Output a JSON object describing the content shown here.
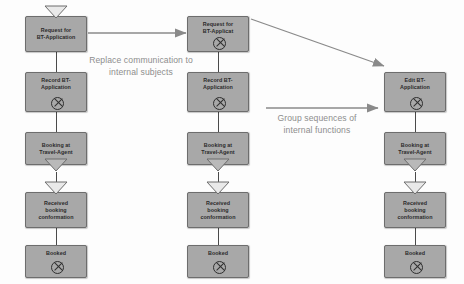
{
  "diagram": {
    "node_fill": "#a8a8a8",
    "node_border": "#6d6d6d",
    "annotation_color": "#8d8d8d",
    "arrow_color": "#8a8a8a",
    "columns": [
      {
        "id": "left",
        "nodes": [
          {
            "id": "l1",
            "label": "Request for\nBT-Application",
            "marker": "receive-triangle-top",
            "end": false
          },
          {
            "id": "l2",
            "label": "Record BT-\nApplication",
            "marker": "none",
            "end": true
          },
          {
            "id": "l3",
            "label": "Booking at\nTravel-Agent",
            "marker": "send-triangle-bottom",
            "end": false
          },
          {
            "id": "l4",
            "label": "Received\nbooking\nconformation",
            "marker": "receive-triangle-top",
            "end": false
          },
          {
            "id": "l5",
            "label": "Booked",
            "marker": "none",
            "end": true
          }
        ]
      },
      {
        "id": "middle",
        "nodes": [
          {
            "id": "m1",
            "label": "Request for\nBT-Applicat",
            "marker": "none",
            "end": true
          },
          {
            "id": "m2",
            "label": "Record BT-\nApplication",
            "marker": "none",
            "end": true
          },
          {
            "id": "m3",
            "label": "Booking at\nTravel-Agent",
            "marker": "send-triangle-bottom",
            "end": false
          },
          {
            "id": "m4",
            "label": "Received\nbooking\nconformation",
            "marker": "receive-triangle-top",
            "end": false
          },
          {
            "id": "m5",
            "label": "Booked",
            "marker": "none",
            "end": true
          }
        ]
      },
      {
        "id": "right",
        "nodes": [
          {
            "id": "r1",
            "label": "Edit BT-\nApplication",
            "marker": "none",
            "end": true
          },
          {
            "id": "r2",
            "label": "Booking at\nTravel-Agent",
            "marker": "send-triangle-bottom",
            "end": false
          },
          {
            "id": "r3",
            "label": "Received\nbooking\nconformation",
            "marker": "receive-triangle-top",
            "end": false
          },
          {
            "id": "r4",
            "label": "Booked",
            "marker": "none",
            "end": true
          }
        ]
      }
    ],
    "annotations": [
      {
        "id": "a1",
        "text": "Replace communication to\ninternal subjects"
      },
      {
        "id": "a2",
        "text": "Group sequences of\ninternal functions"
      }
    ]
  }
}
